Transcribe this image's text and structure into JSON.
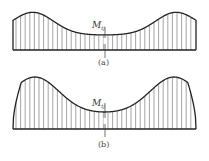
{
  "figure": {
    "panels": [
      {
        "id": "a",
        "caption": "(a)",
        "moment_label": "M",
        "moment_subscript": "tj",
        "description": "Moment distribution with rounded ends: edges start at finite height, peaks near ends, minimum at center"
      },
      {
        "id": "b",
        "caption": "(b)",
        "moment_label": "M",
        "moment_subscript": "tj",
        "description": "Moment distribution dropping to zero at both ends with peaks near ends, minimum at center"
      }
    ],
    "colors": {
      "curve": "#222222",
      "hatch": "#555555",
      "baseline": "#222222",
      "background": "#ffffff"
    }
  }
}
